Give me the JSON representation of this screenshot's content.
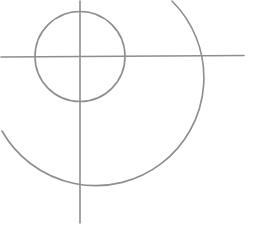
{
  "diagram": {
    "stroke_color": "#8e8e8e",
    "background": "#ffffff",
    "elements": {
      "horizontal_axis": {
        "x1": 0,
        "y1": 57,
        "x2": 244,
        "y2": 55.5
      },
      "vertical_axis": {
        "x1": 80,
        "y1": 0,
        "x2": 80,
        "y2": 223
      },
      "inner_circle": {
        "cx": 80,
        "cy": 56.5,
        "r": 45
      },
      "outer_arc": {
        "cx": 80,
        "cy": 57,
        "r": 108,
        "start": [
          172,
          1
        ],
        "end": [
          2,
          131
        ]
      }
    }
  }
}
